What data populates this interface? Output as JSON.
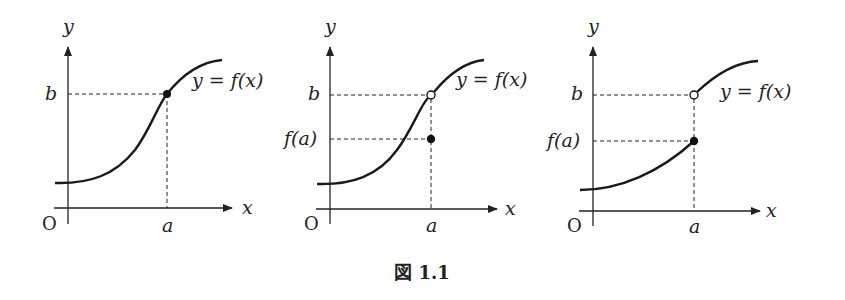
{
  "figure": {
    "caption": "図 1.1",
    "panels": [
      {
        "id": "panel-1",
        "description": "continuous at a",
        "labels": {
          "y_axis": "y",
          "x_axis": "x",
          "origin": "O",
          "a": "a",
          "b": "b",
          "curve": "y = f(x)"
        },
        "points": [
          {
            "type": "filled",
            "at": "(a, b)"
          }
        ]
      },
      {
        "id": "panel-2",
        "description": "removable discontinuity at a",
        "labels": {
          "y_axis": "y",
          "x_axis": "x",
          "origin": "O",
          "a": "a",
          "b": "b",
          "fa": "f(a)",
          "curve": "y = f(x)"
        },
        "points": [
          {
            "type": "open",
            "at": "(a, b)"
          },
          {
            "type": "filled",
            "at": "(a, f(a))"
          }
        ]
      },
      {
        "id": "panel-3",
        "description": "jump discontinuity at a",
        "labels": {
          "y_axis": "y",
          "x_axis": "x",
          "origin": "O",
          "a": "a",
          "b": "b",
          "fa": "f(a)",
          "curve": "y = f(x)"
        },
        "points": [
          {
            "type": "open",
            "at": "(a, b)"
          },
          {
            "type": "filled",
            "at": "(a, f(a))"
          }
        ]
      }
    ]
  }
}
